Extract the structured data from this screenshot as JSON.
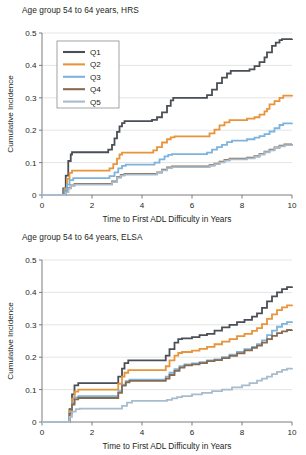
{
  "figure": {
    "width": 306,
    "height": 455
  },
  "colors": {
    "q1": "#4a4f56",
    "q2": "#e8943a",
    "q3": "#7eb3dc",
    "q4": "#8a6a4f",
    "q5": "#a8bccd",
    "axis": "#6d6e71",
    "grid": "#d9dadb",
    "text": "#231f20"
  },
  "panels": [
    {
      "id": "hrs",
      "title": "Age group 54 to 64 years, HRS",
      "has_legend": true
    },
    {
      "id": "elsa",
      "title": "Age group 54 to 64 years, ELSA",
      "has_legend": false
    }
  ],
  "legend": {
    "items": [
      {
        "label": "Q1",
        "color": "#4a4f56"
      },
      {
        "label": "Q2",
        "color": "#e8943a"
      },
      {
        "label": "Q3",
        "color": "#7eb3dc"
      },
      {
        "label": "Q4",
        "color": "#8a6a4f"
      },
      {
        "label": "Q5",
        "color": "#a8bccd"
      }
    ]
  },
  "axes": {
    "x": {
      "label": "Time to First ADL Difficulty in Years",
      "ticks": [
        "0",
        "2",
        "4",
        "6",
        "8",
        "10"
      ],
      "tick_values": [
        0,
        2,
        4,
        6,
        8,
        10
      ],
      "lim": [
        0,
        10
      ]
    },
    "y": {
      "label": "Cumulative Incidence",
      "ticks": [
        "0",
        "0.1",
        "0.2",
        "0.3",
        "0.4",
        "0.5"
      ],
      "tick_values": [
        0,
        0.1,
        0.2,
        0.3,
        0.4,
        0.5
      ],
      "lim": [
        0,
        0.5
      ]
    }
  },
  "chart_data": [
    {
      "type": "line",
      "title": "Age group 54 to 64 years, HRS",
      "xlabel": "Time to First ADL Difficulty in Years",
      "ylabel": "Cumulative Incidence",
      "xlim": [
        0,
        10
      ],
      "ylim": [
        0,
        0.5
      ],
      "grid": "horizontal",
      "legend_position": "upper-left",
      "step": true,
      "series": [
        {
          "name": "Q1",
          "color": "#4a4f56",
          "x": [
            0,
            0.75,
            0.85,
            0.95,
            1.05,
            1.15,
            1.2,
            2.5,
            2.65,
            2.8,
            2.9,
            3.0,
            3.1,
            3.2,
            3.3,
            4.2,
            4.4,
            4.6,
            4.8,
            5.0,
            5.15,
            5.25,
            6.4,
            6.6,
            6.8,
            7.0,
            7.2,
            7.4,
            7.55,
            8.3,
            8.5,
            8.7,
            8.9,
            9.0,
            9.2,
            9.35,
            9.5,
            9.6,
            10.0
          ],
          "y": [
            0,
            0.0,
            0.02,
            0.06,
            0.105,
            0.125,
            0.132,
            0.132,
            0.14,
            0.155,
            0.175,
            0.195,
            0.212,
            0.222,
            0.228,
            0.228,
            0.232,
            0.24,
            0.255,
            0.275,
            0.292,
            0.3,
            0.3,
            0.308,
            0.325,
            0.345,
            0.362,
            0.375,
            0.383,
            0.388,
            0.398,
            0.41,
            0.425,
            0.44,
            0.46,
            0.47,
            0.478,
            0.481,
            0.482
          ]
        },
        {
          "name": "Q2",
          "color": "#e8943a",
          "x": [
            0,
            0.8,
            0.9,
            1.0,
            1.1,
            1.2,
            2.5,
            2.7,
            2.85,
            3.0,
            3.1,
            3.2,
            4.3,
            4.45,
            4.6,
            4.8,
            5.0,
            5.15,
            5.3,
            6.5,
            6.7,
            6.9,
            7.1,
            7.3,
            7.5,
            8.2,
            8.5,
            8.7,
            8.9,
            9.0,
            9.1,
            9.3,
            9.5,
            9.65,
            10.0
          ],
          "y": [
            0,
            0.0,
            0.02,
            0.05,
            0.068,
            0.075,
            0.075,
            0.082,
            0.095,
            0.112,
            0.125,
            0.131,
            0.131,
            0.138,
            0.148,
            0.162,
            0.172,
            0.178,
            0.181,
            0.181,
            0.19,
            0.202,
            0.215,
            0.224,
            0.231,
            0.236,
            0.24,
            0.248,
            0.258,
            0.266,
            0.28,
            0.29,
            0.3,
            0.307,
            0.309
          ]
        },
        {
          "name": "Q3",
          "color": "#7eb3dc",
          "x": [
            0,
            0.8,
            0.9,
            1.0,
            1.1,
            1.25,
            2.5,
            2.7,
            2.9,
            3.05,
            3.2,
            3.35,
            4.3,
            4.5,
            4.7,
            4.9,
            5.05,
            5.2,
            6.4,
            6.6,
            6.8,
            7.0,
            7.2,
            7.4,
            7.6,
            8.2,
            8.5,
            8.7,
            8.9,
            9.1,
            9.3,
            9.5,
            9.65,
            10.0
          ],
          "y": [
            0,
            0.0,
            0.015,
            0.032,
            0.046,
            0.052,
            0.052,
            0.058,
            0.07,
            0.082,
            0.09,
            0.094,
            0.094,
            0.1,
            0.11,
            0.119,
            0.124,
            0.126,
            0.126,
            0.131,
            0.14,
            0.148,
            0.155,
            0.163,
            0.168,
            0.172,
            0.177,
            0.182,
            0.188,
            0.196,
            0.206,
            0.216,
            0.221,
            0.222
          ]
        },
        {
          "name": "Q4",
          "color": "#8a6a4f",
          "x": [
            0,
            0.85,
            0.95,
            1.05,
            1.15,
            1.3,
            2.6,
            2.8,
            3.0,
            3.15,
            3.3,
            4.4,
            4.6,
            4.8,
            5.0,
            5.2,
            6.5,
            6.7,
            6.9,
            7.1,
            7.3,
            7.5,
            8.2,
            8.5,
            8.7,
            8.9,
            9.1,
            9.3,
            9.5,
            9.7,
            10.0
          ],
          "y": [
            0,
            0.0,
            0.01,
            0.022,
            0.03,
            0.034,
            0.034,
            0.042,
            0.055,
            0.062,
            0.065,
            0.065,
            0.07,
            0.078,
            0.085,
            0.088,
            0.088,
            0.092,
            0.097,
            0.103,
            0.108,
            0.112,
            0.115,
            0.12,
            0.127,
            0.134,
            0.14,
            0.147,
            0.152,
            0.156,
            0.157
          ]
        },
        {
          "name": "Q5",
          "color": "#a8bccd",
          "x": [
            0,
            0.85,
            0.95,
            1.05,
            1.15,
            1.3,
            2.6,
            2.8,
            3.0,
            3.15,
            3.3,
            4.4,
            4.6,
            4.8,
            5.0,
            5.2,
            6.5,
            6.7,
            6.9,
            7.1,
            7.3,
            7.5,
            8.2,
            8.5,
            8.7,
            8.9,
            9.1,
            9.3,
            9.5,
            9.7,
            10.0
          ],
          "y": [
            0,
            0.0,
            0.009,
            0.02,
            0.028,
            0.032,
            0.032,
            0.04,
            0.053,
            0.06,
            0.063,
            0.063,
            0.068,
            0.076,
            0.083,
            0.086,
            0.086,
            0.09,
            0.095,
            0.101,
            0.106,
            0.11,
            0.113,
            0.118,
            0.125,
            0.132,
            0.138,
            0.145,
            0.15,
            0.154,
            0.155
          ]
        }
      ]
    },
    {
      "type": "line",
      "title": "Age group 54 to 64 years, ELSA",
      "xlabel": "Time to First ADL Difficulty in Years",
      "ylabel": "Cumulative Incidence",
      "xlim": [
        0,
        10
      ],
      "ylim": [
        0,
        0.5
      ],
      "grid": "horizontal",
      "legend_position": "none",
      "step": true,
      "series": [
        {
          "name": "Q1",
          "color": "#4a4f56",
          "x": [
            0,
            1.0,
            1.1,
            1.2,
            1.3,
            1.45,
            2.9,
            3.05,
            3.2,
            3.3,
            3.45,
            4.8,
            4.95,
            5.1,
            5.3,
            5.45,
            5.6,
            6.0,
            6.3,
            6.6,
            6.9,
            7.2,
            7.5,
            7.8,
            8.1,
            8.4,
            8.6,
            8.8,
            9.0,
            9.2,
            9.4,
            9.6,
            9.8,
            10.0
          ],
          "y": [
            0,
            0.0,
            0.04,
            0.085,
            0.113,
            0.12,
            0.12,
            0.14,
            0.165,
            0.182,
            0.19,
            0.19,
            0.205,
            0.225,
            0.245,
            0.256,
            0.258,
            0.262,
            0.268,
            0.272,
            0.282,
            0.292,
            0.3,
            0.308,
            0.315,
            0.325,
            0.335,
            0.352,
            0.372,
            0.388,
            0.4,
            0.41,
            0.416,
            0.418
          ]
        },
        {
          "name": "Q2",
          "color": "#e8943a",
          "x": [
            0,
            1.0,
            1.1,
            1.2,
            1.3,
            1.45,
            2.9,
            3.05,
            3.2,
            3.3,
            3.45,
            4.8,
            4.95,
            5.1,
            5.3,
            5.45,
            5.6,
            6.0,
            6.3,
            6.6,
            6.9,
            7.2,
            7.5,
            7.8,
            8.1,
            8.4,
            8.6,
            8.8,
            9.0,
            9.2,
            9.4,
            9.6,
            9.8,
            10.0
          ],
          "y": [
            0,
            0.0,
            0.035,
            0.072,
            0.094,
            0.1,
            0.1,
            0.118,
            0.14,
            0.152,
            0.16,
            0.16,
            0.172,
            0.19,
            0.205,
            0.213,
            0.216,
            0.22,
            0.226,
            0.232,
            0.24,
            0.248,
            0.256,
            0.265,
            0.272,
            0.281,
            0.29,
            0.302,
            0.318,
            0.332,
            0.345,
            0.354,
            0.36,
            0.362
          ]
        },
        {
          "name": "Q3",
          "color": "#7eb3dc",
          "x": [
            0,
            1.0,
            1.1,
            1.2,
            1.3,
            1.45,
            2.9,
            3.05,
            3.2,
            3.35,
            3.5,
            4.8,
            4.95,
            5.1,
            5.3,
            5.5,
            5.7,
            6.0,
            6.3,
            6.6,
            6.9,
            7.2,
            7.5,
            7.8,
            8.1,
            8.4,
            8.6,
            8.8,
            9.0,
            9.2,
            9.4,
            9.6,
            9.8,
            10.0
          ],
          "y": [
            0,
            0.0,
            0.028,
            0.058,
            0.076,
            0.08,
            0.08,
            0.095,
            0.115,
            0.126,
            0.131,
            0.131,
            0.14,
            0.152,
            0.163,
            0.172,
            0.178,
            0.181,
            0.185,
            0.19,
            0.193,
            0.2,
            0.208,
            0.216,
            0.225,
            0.232,
            0.24,
            0.252,
            0.268,
            0.282,
            0.294,
            0.303,
            0.308,
            0.31
          ]
        },
        {
          "name": "Q4",
          "color": "#8a6a4f",
          "x": [
            0,
            1.0,
            1.1,
            1.2,
            1.3,
            1.45,
            2.9,
            3.05,
            3.2,
            3.35,
            3.5,
            4.8,
            4.95,
            5.1,
            5.3,
            5.5,
            5.7,
            6.0,
            6.3,
            6.6,
            6.9,
            7.2,
            7.5,
            7.8,
            8.1,
            8.4,
            8.6,
            8.8,
            9.0,
            9.2,
            9.4,
            9.6,
            9.8,
            10.0
          ],
          "y": [
            0,
            0.0,
            0.026,
            0.054,
            0.07,
            0.074,
            0.074,
            0.09,
            0.112,
            0.122,
            0.127,
            0.127,
            0.134,
            0.145,
            0.158,
            0.168,
            0.175,
            0.178,
            0.182,
            0.188,
            0.191,
            0.197,
            0.204,
            0.212,
            0.221,
            0.229,
            0.236,
            0.245,
            0.256,
            0.266,
            0.274,
            0.28,
            0.284,
            0.285
          ]
        },
        {
          "name": "Q5",
          "color": "#a8bccd",
          "x": [
            0,
            1.0,
            1.1,
            1.2,
            1.35,
            1.5,
            3.0,
            3.2,
            3.4,
            3.6,
            4.8,
            5.0,
            5.2,
            5.4,
            5.6,
            6.0,
            6.4,
            6.8,
            7.2,
            7.6,
            8.0,
            8.3,
            8.6,
            8.8,
            9.0,
            9.2,
            9.4,
            9.6,
            9.8,
            10.0
          ],
          "y": [
            0,
            0.0,
            0.016,
            0.032,
            0.04,
            0.041,
            0.041,
            0.05,
            0.06,
            0.065,
            0.065,
            0.068,
            0.073,
            0.077,
            0.08,
            0.085,
            0.09,
            0.095,
            0.1,
            0.107,
            0.113,
            0.12,
            0.128,
            0.134,
            0.14,
            0.148,
            0.155,
            0.161,
            0.165,
            0.167
          ]
        }
      ]
    }
  ]
}
